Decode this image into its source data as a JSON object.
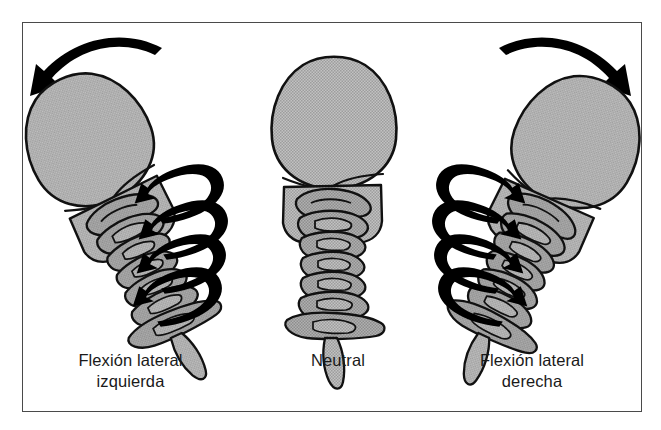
{
  "figure": {
    "type": "medical-illustration",
    "language": "es",
    "border_color": "#4a4a4a",
    "background_color": "#ffffff",
    "bone_fill_color": "#b3b3b3",
    "bone_outline_color": "#111111",
    "arrow_color": "#000000",
    "panels": [
      {
        "id": "left",
        "caption_lines": [
          "Flexión lateral",
          "izquierda"
        ],
        "head_tilt_degrees": -25,
        "tilt_direction": "left",
        "top_arrow": {
          "present": true,
          "direction": "left",
          "name": "lateral-flexion-arrow-left"
        },
        "rotation_arrows": {
          "count": 4,
          "side": "right",
          "pointing": "left"
        }
      },
      {
        "id": "middle",
        "caption_lines": [
          "Neutral"
        ],
        "head_tilt_degrees": 0,
        "tilt_direction": "none",
        "top_arrow": {
          "present": false,
          "direction": "none",
          "name": "none"
        },
        "rotation_arrows": {
          "count": 0,
          "side": "none",
          "pointing": "none"
        }
      },
      {
        "id": "right",
        "caption_lines": [
          "Flexión lateral",
          "derecha"
        ],
        "head_tilt_degrees": 25,
        "tilt_direction": "right",
        "top_arrow": {
          "present": true,
          "direction": "right",
          "name": "lateral-flexion-arrow-right"
        },
        "rotation_arrows": {
          "count": 4,
          "side": "left",
          "pointing": "right"
        }
      }
    ]
  },
  "captions": {
    "left": {
      "line1": "Flexión lateral",
      "line2": "izquierda"
    },
    "middle": {
      "line1": "Neutral"
    },
    "right": {
      "line1": "Flexión lateral",
      "line2": "derecha"
    }
  }
}
